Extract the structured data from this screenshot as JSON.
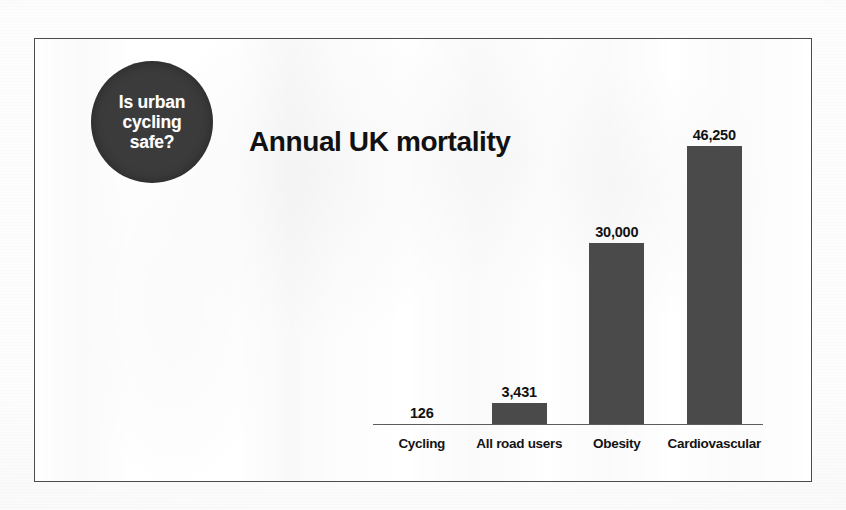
{
  "badge": {
    "lines": [
      "Is urban",
      "cycling",
      "safe?"
    ],
    "line1": "Is urban",
    "line2": "cycling",
    "line3": "safe?",
    "fill_color": "#3b3b3b",
    "text_color": "#ffffff"
  },
  "chart_data": {
    "type": "bar",
    "title": "Annual UK mortality",
    "xlabel": "",
    "ylabel": "",
    "categories": [
      "Cycling",
      "All road users",
      "Obesity",
      "Cardiovascular"
    ],
    "values": [
      126,
      3431,
      30000,
      46250
    ],
    "value_labels": [
      "126",
      "3,431",
      "30,000",
      "46,250"
    ],
    "ylim": [
      0,
      46250
    ],
    "grid": false,
    "legend": null,
    "bar_color": "#4a4a4a",
    "axis_color": "#5c5c5c",
    "value_label_position": "above-bar"
  },
  "frame": {
    "border_color": "#4a4a4a",
    "background_color": "#ffffff"
  }
}
